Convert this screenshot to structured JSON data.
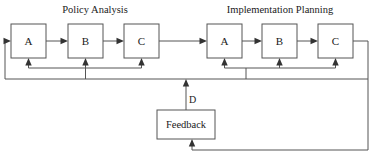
{
  "diagram": {
    "type": "flow-diagram",
    "title": "",
    "groups": [
      {
        "id": "policy-analysis",
        "title": "Policy Analysis",
        "title_x": 95,
        "title_y": 13,
        "nodes": [
          {
            "id": "pa-a",
            "label": "A",
            "x": 11,
            "y": 24,
            "w": 35,
            "h": 34
          },
          {
            "id": "pa-b",
            "label": "B",
            "x": 68,
            "y": 24,
            "w": 35,
            "h": 34
          },
          {
            "id": "pa-c",
            "label": "C",
            "x": 124,
            "y": 24,
            "w": 35,
            "h": 34
          }
        ]
      },
      {
        "id": "implementation-planning",
        "title": "Implementation Planning",
        "title_x": 280,
        "title_y": 13,
        "nodes": [
          {
            "id": "ip-a",
            "label": "A",
            "x": 207,
            "y": 24,
            "w": 35,
            "h": 34
          },
          {
            "id": "ip-b",
            "label": "B",
            "x": 262,
            "y": 24,
            "w": 35,
            "h": 34
          },
          {
            "id": "ip-c",
            "label": "C",
            "x": 318,
            "y": 24,
            "w": 35,
            "h": 34
          }
        ]
      }
    ],
    "feedback_node": {
      "id": "feedback",
      "label": "Feedback",
      "x": 157,
      "y": 110,
      "w": 58,
      "h": 29
    },
    "edge_labels": [
      {
        "id": "label-d",
        "text": "D",
        "x": 189,
        "y": 103
      }
    ],
    "colors": {
      "box_stroke": "#555555",
      "line_stroke": "#555555",
      "arrow_fill": "#333333",
      "text": "#1a1a1a",
      "background": "#ffffff"
    }
  }
}
